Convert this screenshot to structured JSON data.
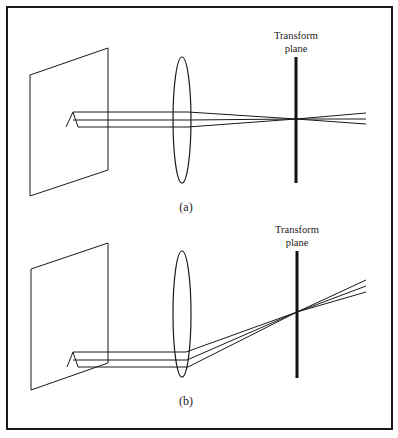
{
  "figure": {
    "panels": [
      {
        "id": "a",
        "caption": "(a)",
        "transform_label_line1": "Transform",
        "transform_label_line2": "plane",
        "object_glyph": "A",
        "description": "Parallel rays from object pass through lens and converge on-axis at the transform plane"
      },
      {
        "id": "b",
        "caption": "(b)",
        "transform_label_line1": "Transform",
        "transform_label_line2": "plane",
        "object_glyph": "A",
        "description": "Off-axis parallel rays pass through lens and converge at the same point on the transform plane"
      }
    ],
    "colors": {
      "line": "#1a1a1a",
      "background": "#ffffff",
      "border": "#1a1a1a"
    }
  }
}
